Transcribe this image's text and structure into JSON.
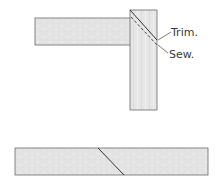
{
  "diagram": {
    "labels": {
      "trim": "Trim.",
      "sew": "Sew."
    },
    "colors": {
      "strip_fill": "#e4e4e4",
      "strip_stroke": "#555555",
      "line": "#333333"
    }
  }
}
